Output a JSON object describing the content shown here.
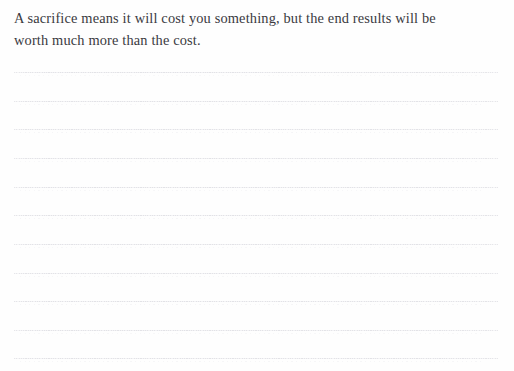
{
  "page": {
    "kind": "ruled-journal-page",
    "background_color": "#fefefe",
    "width": 514,
    "height": 371
  },
  "quote": {
    "lines": [
      "A sacrifice means it will cost you something, but the end results will be",
      "worth much more than the cost."
    ],
    "full_text": "A sacrifice means it will cost you something, but the end results will be worth much more than the cost.",
    "text_color": "#3a3a3f"
  },
  "ruling": {
    "line_color": "#e4e4e9",
    "count": 11,
    "left_margin_px": 14,
    "right_edge_px": 498,
    "spacing_px": 28.7,
    "first_line_y_px": 72,
    "y_positions": [
      72,
      101,
      129,
      158,
      187,
      215,
      244,
      273,
      301,
      330,
      358
    ]
  }
}
